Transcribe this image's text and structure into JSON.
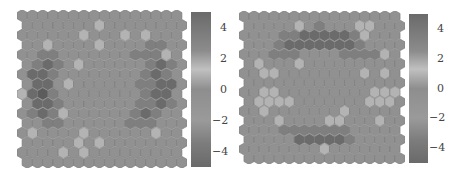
{
  "chart_data": [
    {
      "type": "heatmap",
      "subtype": "hexagonal-som-component-plane",
      "title": "",
      "grid": {
        "rows": 16,
        "cols": 16
      },
      "colorbar": {
        "ticks": [
          4,
          2,
          0,
          -2,
          -4
        ],
        "tick_labels": [
          "4",
          "2",
          "0",
          "−2",
          "−4"
        ],
        "range": [
          -5,
          5
        ]
      },
      "description": "Ring-shaped darker (high |value|) region around the left and right sides; lighter cells scattered near center-left",
      "values": [
        [
          0,
          0,
          0,
          0,
          0,
          0,
          0,
          0,
          0,
          0,
          0,
          0,
          0,
          0,
          0,
          0
        ],
        [
          0,
          0,
          0,
          0,
          0,
          0,
          0,
          1,
          0,
          0,
          0,
          0,
          0,
          0,
          0,
          0
        ],
        [
          0,
          0,
          0,
          0,
          0,
          0,
          1,
          0,
          0,
          0,
          1,
          0,
          1,
          0,
          0,
          0
        ],
        [
          0,
          0,
          1,
          0,
          0,
          0,
          0,
          1,
          0,
          0,
          0,
          0,
          -1,
          -1,
          0,
          0
        ],
        [
          0,
          0,
          -1,
          -1,
          0,
          0,
          0,
          0,
          0,
          0,
          0,
          -1,
          -1,
          -1,
          1,
          0
        ],
        [
          0,
          -1,
          -2,
          -1,
          0,
          1,
          0,
          0,
          0,
          0,
          0,
          0,
          -1,
          -2,
          -1,
          0
        ],
        [
          0,
          -2,
          -2,
          -1,
          0,
          0,
          0,
          0,
          0,
          0,
          0,
          0,
          -1,
          -2,
          -1,
          0
        ],
        [
          0,
          -2,
          -2,
          0,
          1,
          0,
          0,
          0,
          0,
          0,
          0,
          -1,
          -1,
          -2,
          -2,
          0
        ],
        [
          1,
          -2,
          -3,
          -1,
          0,
          0,
          0,
          0,
          0,
          0,
          0,
          0,
          -1,
          -2,
          -2,
          0
        ],
        [
          0,
          -2,
          -2,
          -1,
          0,
          0,
          0,
          0,
          0,
          0,
          0,
          -1,
          -1,
          -2,
          -1,
          0
        ],
        [
          0,
          -1,
          -2,
          -1,
          1,
          0,
          0,
          0,
          0,
          0,
          0,
          -1,
          -2,
          -1,
          0,
          0
        ],
        [
          0,
          0,
          -1,
          -1,
          0,
          0,
          0,
          0,
          0,
          0,
          -1,
          -1,
          -1,
          0,
          0,
          0
        ],
        [
          0,
          1,
          0,
          0,
          0,
          0,
          1,
          0,
          0,
          0,
          0,
          0,
          0,
          1,
          0,
          0
        ],
        [
          0,
          0,
          0,
          0,
          0,
          1,
          0,
          1,
          0,
          0,
          0,
          0,
          0,
          0,
          0,
          0
        ],
        [
          0,
          0,
          0,
          0,
          1,
          0,
          1,
          0,
          0,
          0,
          0,
          0,
          0,
          0,
          0,
          0
        ],
        [
          0,
          0,
          0,
          0,
          0,
          0,
          0,
          0,
          0,
          0,
          0,
          0,
          0,
          0,
          0,
          0
        ]
      ]
    },
    {
      "type": "heatmap",
      "subtype": "hexagonal-som-component-plane",
      "title": "",
      "grid": {
        "rows": 16,
        "cols": 16
      },
      "colorbar": {
        "ticks": [
          4,
          2,
          0,
          -2,
          -4
        ],
        "tick_labels": [
          "4",
          "2",
          "0",
          "−2",
          "−4"
        ],
        "range": [
          -5,
          5
        ]
      },
      "description": "Darker arc band across the top and bottom; lighter cells along left and mid-right",
      "values": [
        [
          0,
          0,
          0,
          0,
          0,
          0,
          0,
          0,
          0,
          0,
          0,
          0,
          0,
          0,
          0,
          0
        ],
        [
          0,
          0,
          0,
          0,
          0,
          1,
          0,
          -1,
          0,
          0,
          0,
          1,
          1,
          0,
          0,
          0
        ],
        [
          0,
          0,
          0,
          0,
          -1,
          -1,
          -2,
          -2,
          -2,
          -2,
          -2,
          -1,
          1,
          0,
          0,
          0
        ],
        [
          0,
          0,
          0,
          -1,
          -2,
          -2,
          -2,
          -2,
          -2,
          -2,
          -2,
          -1,
          0,
          0,
          0,
          0
        ],
        [
          0,
          0,
          0,
          -1,
          -1,
          -1,
          0,
          0,
          0,
          0,
          -1,
          -1,
          -1,
          -1,
          1,
          0
        ],
        [
          0,
          1,
          0,
          0,
          0,
          1,
          0,
          0,
          0,
          0,
          0,
          0,
          0,
          0,
          0,
          0
        ],
        [
          0,
          0,
          1,
          1,
          0,
          0,
          0,
          0,
          0,
          0,
          0,
          0,
          1,
          0,
          1,
          0
        ],
        [
          0,
          0,
          0,
          0,
          0,
          0,
          0,
          0,
          0,
          0,
          0,
          0,
          0,
          0,
          0,
          0
        ],
        [
          0,
          0,
          1,
          1,
          0,
          0,
          0,
          0,
          0,
          0,
          0,
          0,
          0,
          1,
          1,
          1
        ],
        [
          0,
          1,
          1,
          1,
          1,
          0,
          0,
          0,
          0,
          0,
          0,
          0,
          1,
          1,
          1,
          0
        ],
        [
          0,
          0,
          1,
          0,
          0,
          0,
          0,
          0,
          0,
          0,
          1,
          0,
          0,
          0,
          0,
          0
        ],
        [
          0,
          0,
          0,
          1,
          0,
          0,
          0,
          0,
          1,
          1,
          0,
          0,
          0,
          1,
          0,
          0
        ],
        [
          0,
          0,
          0,
          0,
          -1,
          -1,
          -1,
          -1,
          -1,
          -1,
          -1,
          0,
          0,
          0,
          0,
          0
        ],
        [
          0,
          0,
          0,
          0,
          0,
          -2,
          -2,
          -2,
          -2,
          -2,
          -1,
          0,
          0,
          0,
          0,
          0
        ],
        [
          0,
          0,
          0,
          0,
          0,
          0,
          0,
          0,
          1,
          0,
          0,
          0,
          0,
          0,
          0,
          0
        ],
        [
          0,
          0,
          0,
          0,
          0,
          0,
          0,
          0,
          0,
          0,
          0,
          0,
          0,
          0,
          0,
          0
        ]
      ]
    }
  ],
  "colors": {
    "base": "#8f8f8f",
    "light": "#c4c4c4",
    "dark": "#5e5e5e",
    "edge": "#7a7a7a"
  }
}
